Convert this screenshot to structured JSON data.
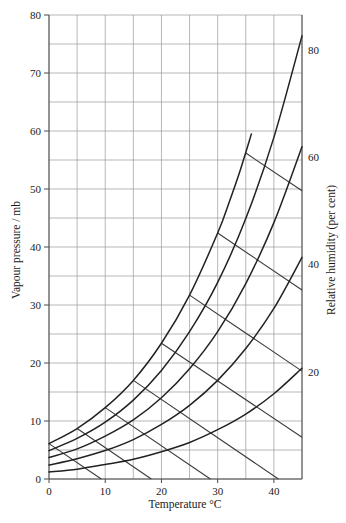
{
  "chart_data": {
    "type": "line",
    "title": "",
    "xlabel": "Temperature °C",
    "ylabel": "Vapour pressure / mb",
    "y2label": "Relative humidity (per cent)",
    "xlim": [
      0,
      45
    ],
    "ylim": [
      0,
      80
    ],
    "grid": true,
    "grid_x_step": 5,
    "grid_y_step": 5,
    "x_ticks": [
      0,
      10,
      20,
      30,
      40
    ],
    "x_tick_labels": [
      "0",
      "10",
      "20",
      "30",
      "40"
    ],
    "y_ticks": [
      0,
      10,
      20,
      30,
      40,
      50,
      60,
      70,
      80
    ],
    "y_tick_labels": [
      "0",
      "10",
      "20",
      "30",
      "40",
      "50",
      "60",
      "70",
      "80"
    ],
    "legend": "none",
    "annotations": [
      {
        "text": "80",
        "x": 45,
        "y": 74.0,
        "series": "rh-80"
      },
      {
        "text": "60",
        "x": 45,
        "y": 55.5,
        "series": "rh-60"
      },
      {
        "text": "40",
        "x": 45,
        "y": 37.0,
        "series": "rh-40"
      },
      {
        "text": "20",
        "x": 45,
        "y": 18.5,
        "series": "rh-20"
      }
    ],
    "series": [
      {
        "name": "Relative humidity 100%",
        "rh": 100,
        "kind": "saturation-curve",
        "x": [
          0,
          5,
          10,
          15,
          20,
          25,
          30,
          32,
          34,
          36
        ],
        "values": [
          6.1,
          8.7,
          12.3,
          17.0,
          23.4,
          31.7,
          42.4,
          47.6,
          53.2,
          59.5
        ]
      },
      {
        "name": "Relative humidity 80%",
        "rh": 80,
        "kind": "rh-curve",
        "x": [
          0,
          5,
          10,
          15,
          20,
          25,
          30,
          35,
          40,
          45
        ],
        "values": [
          4.9,
          7.0,
          9.8,
          13.6,
          18.7,
          25.4,
          33.9,
          44.9,
          58.9,
          76.4
        ]
      },
      {
        "name": "Relative humidity 60%",
        "rh": 60,
        "kind": "rh-curve",
        "x": [
          0,
          5,
          10,
          15,
          20,
          25,
          30,
          35,
          40,
          45
        ],
        "values": [
          3.7,
          5.2,
          7.4,
          10.2,
          14.0,
          19.0,
          25.4,
          33.7,
          44.2,
          57.3
        ]
      },
      {
        "name": "Relative humidity 40%",
        "rh": 40,
        "kind": "rh-curve",
        "x": [
          0,
          5,
          10,
          15,
          20,
          25,
          30,
          35,
          40,
          45
        ],
        "values": [
          2.4,
          3.5,
          4.9,
          6.8,
          9.4,
          12.7,
          17.0,
          22.5,
          29.4,
          38.2
        ]
      },
      {
        "name": "Relative humidity 20%",
        "rh": 20,
        "kind": "rh-curve",
        "x": [
          0,
          5,
          10,
          15,
          20,
          25,
          30,
          35,
          40,
          45
        ],
        "values": [
          1.2,
          1.7,
          2.5,
          3.4,
          4.7,
          6.3,
          8.5,
          11.2,
          14.7,
          19.1
        ]
      },
      {
        "name": "Wet-bulb line 0",
        "kind": "wet-bulb-line",
        "x": [
          0,
          9.3
        ],
        "values": [
          6.1,
          0.0
        ]
      },
      {
        "name": "Wet-bulb line 5",
        "kind": "wet-bulb-line",
        "x": [
          5,
          18.2
        ],
        "values": [
          8.7,
          0.0
        ]
      },
      {
        "name": "Wet-bulb line 10",
        "kind": "wet-bulb-line",
        "x": [
          10,
          28.7
        ],
        "values": [
          12.3,
          0.0
        ]
      },
      {
        "name": "Wet-bulb line 15",
        "kind": "wet-bulb-line",
        "x": [
          15,
          40.8
        ],
        "values": [
          17.0,
          0.0
        ]
      },
      {
        "name": "Wet-bulb line 20",
        "kind": "wet-bulb-line",
        "x": [
          20,
          45
        ],
        "values": [
          23.4,
          7.2
        ]
      },
      {
        "name": "Wet-bulb line 25",
        "kind": "wet-bulb-line",
        "x": [
          25,
          45
        ],
        "values": [
          31.7,
          18.6
        ]
      },
      {
        "name": "Wet-bulb line 30",
        "kind": "wet-bulb-line",
        "x": [
          30,
          45
        ],
        "values": [
          42.4,
          32.6
        ]
      },
      {
        "name": "Wet-bulb line 35",
        "kind": "wet-bulb-line",
        "x": [
          35,
          45
        ],
        "values": [
          56.2,
          49.7
        ]
      }
    ]
  },
  "axes": {
    "left": {
      "title": "Vapour pressure / mb"
    },
    "right": {
      "title": "Relative humidity (per cent)"
    },
    "bottom": {
      "title": "Temperature °C"
    }
  }
}
